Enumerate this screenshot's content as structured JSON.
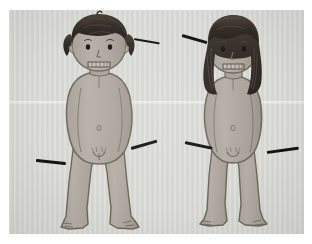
{
  "page": {
    "background_color": "#ffffff",
    "width": 312,
    "height": 244
  },
  "caption": {
    "text": "— —— —— — — —— — — —— ——",
    "note": "clipped text row at top of screenshot, only bottom pixel sliver visible"
  },
  "plate": {
    "label": "figure-drawing-plate",
    "paper_color": "#d9d9d6",
    "ink_color": "#15130f",
    "skin_color": "#b3ada6",
    "skin_shadow_color": "#9a948d",
    "hair_color": "#3b352f",
    "outline_color": "#6e675f",
    "crease_note": "horizontal fold line across page"
  },
  "figures": [
    {
      "id": "figure-boy",
      "label": "short-haired figure",
      "position": "left",
      "hair": "short curly dark hair",
      "pose": "standing front-facing, arms at sides",
      "expression": "neutral mouth with teeth"
    },
    {
      "id": "figure-girl",
      "label": "long-haired figure",
      "position": "right",
      "hair": "long dark hair past shoulders",
      "pose": "standing front-facing, arms at sides",
      "expression": "neutral mouth with teeth"
    }
  ],
  "pointers": [
    {
      "id": "pointer-boy-head",
      "target": "head",
      "figure": "figure-boy"
    },
    {
      "id": "pointer-boy-hip-right",
      "target": "hip-right",
      "figure": "figure-boy"
    },
    {
      "id": "pointer-boy-hip-left",
      "target": "hip-left",
      "figure": "figure-boy"
    },
    {
      "id": "pointer-girl-head",
      "target": "head",
      "figure": "figure-girl"
    },
    {
      "id": "pointer-girl-hip-left",
      "target": "hip-left",
      "figure": "figure-girl"
    },
    {
      "id": "pointer-girl-hip-right",
      "target": "hip-right",
      "figure": "figure-girl"
    }
  ]
}
